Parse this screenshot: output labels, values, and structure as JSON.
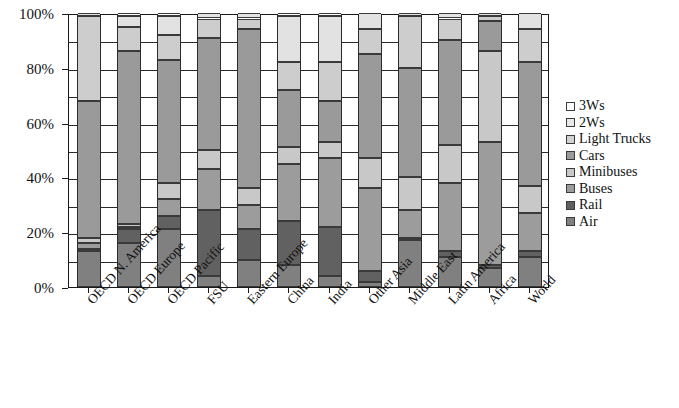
{
  "chart_data": {
    "type": "bar",
    "subtype": "stacked-100-percent",
    "title": "",
    "xlabel": "",
    "ylabel": "",
    "ylim": [
      0,
      100
    ],
    "ytick_labels": [
      "0%",
      "20%",
      "40%",
      "60%",
      "80%",
      "100%"
    ],
    "ytick_values": [
      0,
      20,
      40,
      60,
      80,
      100
    ],
    "gridline_values": [
      0,
      10,
      20,
      30,
      40,
      50,
      60,
      70,
      80,
      90,
      100
    ],
    "grid": true,
    "legend_position": "right",
    "stack_order_bottom_to_top": [
      "Air",
      "Rail",
      "Buses",
      "Minibuses",
      "Cars",
      "Light Trucks",
      "2Ws",
      "3Ws"
    ],
    "categories": [
      "OECD N. America",
      "OECD Europe",
      "OECD Pacific",
      "FSU",
      "Eastern Europe",
      "China",
      "India",
      "Other Asia",
      "Middle East",
      "Latin America",
      "Africa",
      "World"
    ],
    "series": [
      {
        "name": "Air",
        "color": "#808080",
        "values": [
          13,
          16,
          21,
          4,
          10,
          8,
          4,
          2,
          17,
          11,
          7,
          11
        ]
      },
      {
        "name": "Rail",
        "color": "#616161",
        "values": [
          1,
          5,
          5,
          24,
          11,
          16,
          18,
          4,
          1,
          2,
          1,
          2
        ]
      },
      {
        "name": "Buses",
        "color": "#9c9c9c",
        "values": [
          2,
          1,
          6,
          15,
          9,
          21,
          25,
          30,
          10,
          25,
          45,
          14
        ]
      },
      {
        "name": "Minibuses",
        "color": "#c8c8c8",
        "values": [
          2,
          1,
          6,
          7,
          6,
          6,
          6,
          11,
          12,
          14,
          33,
          10
        ]
      },
      {
        "name": "Cars",
        "color": "#9a9a9a",
        "values": [
          50,
          63,
          45,
          41,
          58,
          21,
          15,
          38,
          40,
          38,
          11,
          45
        ]
      },
      {
        "name": "Light Trucks",
        "color": "#cdcdcd",
        "values": [
          31,
          9,
          9,
          7,
          4,
          10,
          14,
          9,
          19,
          8,
          2,
          12
        ]
      },
      {
        "name": "2Ws",
        "color": "#e2e2e2",
        "values": [
          1,
          4,
          7,
          2,
          2,
          17,
          17,
          6,
          1,
          2,
          1,
          6
        ]
      },
      {
        "name": "3Ws",
        "color": "#ffffff",
        "values": [
          0,
          1,
          1,
          0,
          0,
          1,
          1,
          0,
          0,
          0,
          0,
          0
        ]
      }
    ],
    "legend_entries": [
      {
        "label": "3Ws",
        "color": "#ffffff"
      },
      {
        "label": "2Ws",
        "color": "#e8e8e8"
      },
      {
        "label": "Light Trucks",
        "color": "#d2d2d2"
      },
      {
        "label": "Cars",
        "color": "#9a9a9a"
      },
      {
        "label": "Minibuses",
        "color": "#c8c8c8"
      },
      {
        "label": "Buses",
        "color": "#9c9c9c"
      },
      {
        "label": "Rail",
        "color": "#606060"
      },
      {
        "label": "Air",
        "color": "#808080"
      }
    ]
  },
  "axis": {
    "y_ticks": [
      "100%",
      "80%",
      "60%",
      "40%",
      "20%",
      "0%"
    ]
  }
}
